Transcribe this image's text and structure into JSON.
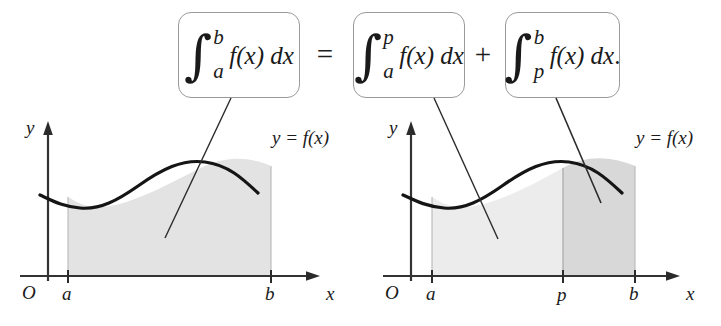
{
  "figure": {
    "equation_plain": "integral from a to b of f(x) dx = integral from a to p of f(x) dx + integral from p to b of f(x) dx."
  },
  "formula": {
    "boxes": [
      {
        "id": "box-left",
        "integral_sign": "∫",
        "lower_limit": "a",
        "upper_limit": "b",
        "integrand": "f(x) dx",
        "trailing": ""
      },
      {
        "id": "box-middle",
        "integral_sign": "∫",
        "lower_limit": "a",
        "upper_limit": "p",
        "integrand": "f(x) dx",
        "trailing": ""
      },
      {
        "id": "box-right",
        "integral_sign": "∫",
        "lower_limit": "p",
        "upper_limit": "b",
        "integrand": "f(x) dx",
        "trailing": "."
      }
    ],
    "operators": {
      "equals": "=",
      "plus": "+"
    }
  },
  "graphs": [
    {
      "id": "graph-left",
      "y_axis_label": "y",
      "x_axis_label": "x",
      "origin_label": "O",
      "curve_label": "y = f(x)",
      "tick_labels": [
        "a",
        "b"
      ],
      "regions": [
        {
          "from": "a",
          "to": "b",
          "fill": "#e3e3e3"
        }
      ]
    },
    {
      "id": "graph-right",
      "y_axis_label": "y",
      "x_axis_label": "x",
      "origin_label": "O",
      "curve_label": "y = f(x)",
      "tick_labels": [
        "a",
        "p",
        "b"
      ],
      "regions": [
        {
          "from": "a",
          "to": "p",
          "fill": "#ececec"
        },
        {
          "from": "p",
          "to": "b",
          "fill": "#d8d8d8"
        }
      ]
    }
  ],
  "colors": {
    "ink": "#1a1a1a",
    "box_border": "#9a9a9a",
    "axis": "#3a3a3a",
    "shade_light": "#ececec",
    "shade_mid": "#e3e3e3",
    "shade_dark": "#d8d8d8"
  }
}
